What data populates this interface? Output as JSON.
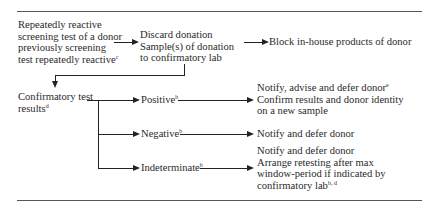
{
  "diagram": {
    "start_node": {
      "lines": [
        "Repeatedly reactive",
        "screening test of a donor",
        "previously screening",
        "test repeatedly reactive"
      ],
      "footnote": "c"
    },
    "discard_node": {
      "lines": [
        "Discard donation",
        "Sample(s) of donation",
        "to confirmatory lab"
      ]
    },
    "block_node": {
      "text": "Block in-house products of donor"
    },
    "confirmatory_node": {
      "lines": [
        "Confirmatory test",
        "results"
      ],
      "footnote": "d"
    },
    "results": [
      {
        "label": "Positive",
        "footnote": "b",
        "action_lines": [
          "Notify, advise and defer donor",
          "Confirm results and donor identity",
          "on a new sample"
        ],
        "action_footnote": "e"
      },
      {
        "label": "Negative",
        "footnote": "b",
        "action_lines": [
          "Notify and defer donor"
        ],
        "action_footnote": ""
      },
      {
        "label": "Indeterminate",
        "footnote": "b",
        "action_lines": [
          "Notify and defer donor",
          "Arrange retesting after max",
          "window-period if indicated by",
          "confirmatory lab"
        ],
        "action_footnote": "b, d"
      }
    ],
    "colors": {
      "text": "#2a2a2a",
      "lines": "#222222",
      "rules": "#555555",
      "background": "#ffffff"
    }
  }
}
